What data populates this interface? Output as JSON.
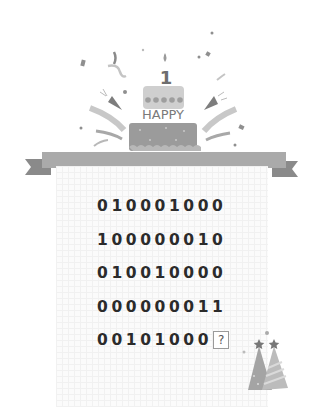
{
  "banner": {
    "cake_text": "HAPPY",
    "candle_number": "1"
  },
  "puzzle": {
    "rows": [
      "010001000",
      "100000010",
      "010010000",
      "000000011",
      "00101000"
    ],
    "missing_marker": "?"
  },
  "colors": {
    "ribbon": "#aaaaaa",
    "ribbon_tail": "#8a8a8a",
    "cake_bottom": "#9b9b9b",
    "cake_top": "#cfcfcf",
    "text": "#2b2b2b"
  }
}
